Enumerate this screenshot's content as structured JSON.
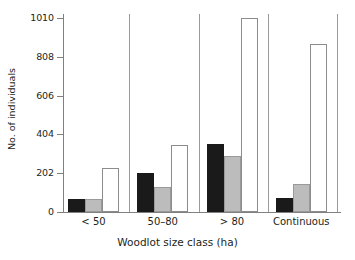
{
  "chart_data": {
    "type": "bar",
    "title": "",
    "subtitle": "",
    "xlabel": "Woodlot size class (ha)",
    "ylabel": "No. of individuals",
    "categories": [
      "< 50",
      "50–80",
      "> 80",
      "Continuous"
    ],
    "series": [
      {
        "name": "black",
        "color": "#1a1a1a",
        "values": [
          70,
          205,
          355,
          75
        ]
      },
      {
        "name": "gray",
        "color": "#bcbcbc",
        "values": [
          70,
          130,
          290,
          145
        ]
      },
      {
        "name": "white",
        "color": "#ffffff",
        "values": [
          228,
          350,
          1010,
          875
        ]
      }
    ],
    "ylim": [
      0,
      1010
    ],
    "yticks": [
      0,
      202,
      404,
      606,
      808,
      1010
    ],
    "ytick_labels": [
      "0",
      "202",
      "404",
      "606",
      "808",
      "1010"
    ],
    "grid": false,
    "legend": "none",
    "axis_color": "#808080"
  }
}
